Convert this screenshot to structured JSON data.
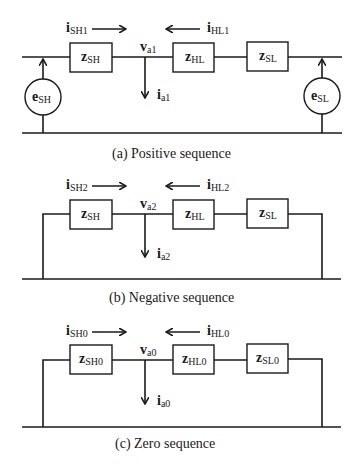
{
  "diagrams": [
    {
      "id": "a",
      "caption": "(a)  Positive sequence",
      "current_left": {
        "main": "i",
        "sub": "SH1"
      },
      "current_right": {
        "main": "i",
        "sub": "HL1"
      },
      "node_voltage": {
        "main": "v",
        "sub": "a1"
      },
      "fault_current": {
        "main": "i",
        "sub": "a1"
      },
      "impedances": [
        {
          "main": "z",
          "sub": "SH"
        },
        {
          "main": "z",
          "sub": "HL"
        },
        {
          "main": "z",
          "sub": "SL"
        }
      ],
      "sources": [
        {
          "main": "e",
          "sub": "SH"
        },
        {
          "main": "e",
          "sub": "SL"
        }
      ]
    },
    {
      "id": "b",
      "caption": "(b)  Negative sequence",
      "current_left": {
        "main": "i",
        "sub": "SH2"
      },
      "current_right": {
        "main": "i",
        "sub": "HL2"
      },
      "node_voltage": {
        "main": "v",
        "sub": "a2"
      },
      "fault_current": {
        "main": "i",
        "sub": "a2"
      },
      "impedances": [
        {
          "main": "z",
          "sub": "SH"
        },
        {
          "main": "z",
          "sub": "HL"
        },
        {
          "main": "z",
          "sub": "SL"
        }
      ]
    },
    {
      "id": "c",
      "caption": "(c)  Zero sequence",
      "current_left": {
        "main": "i",
        "sub": "SH0"
      },
      "current_right": {
        "main": "i",
        "sub": "HL0"
      },
      "node_voltage": {
        "main": "v",
        "sub": "a0"
      },
      "fault_current": {
        "main": "i",
        "sub": "a0"
      },
      "impedances": [
        {
          "main": "z",
          "sub": "SH0"
        },
        {
          "main": "z",
          "sub": "HL0"
        },
        {
          "main": "z",
          "sub": "SL0"
        }
      ]
    }
  ]
}
